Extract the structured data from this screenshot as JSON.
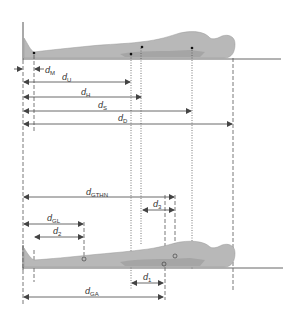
{
  "diagram": {
    "colors": {
      "line": "#555555",
      "body": "#b5b5b5",
      "body_dark": "#8a8a8a",
      "ground": "#666666"
    },
    "top_figure": {
      "labels": {
        "dM": {
          "main": "d",
          "sub": "M"
        },
        "dU": {
          "main": "d",
          "sub": "U"
        },
        "dH": {
          "main": "d",
          "sub": "H"
        },
        "dS": {
          "main": "d",
          "sub": "S"
        },
        "dD": {
          "main": "d",
          "sub": "D"
        }
      }
    },
    "bottom_figure": {
      "labels": {
        "dGTHN": {
          "main": "d",
          "sub": "GTHN"
        },
        "d3": {
          "main": "d",
          "sub": "3"
        },
        "dGL": {
          "main": "d",
          "sub": "GL"
        },
        "d2": {
          "main": "d",
          "sub": "2"
        },
        "d1": {
          "main": "d",
          "sub": "1"
        },
        "dGA": {
          "main": "d",
          "sub": "GA"
        }
      }
    }
  }
}
